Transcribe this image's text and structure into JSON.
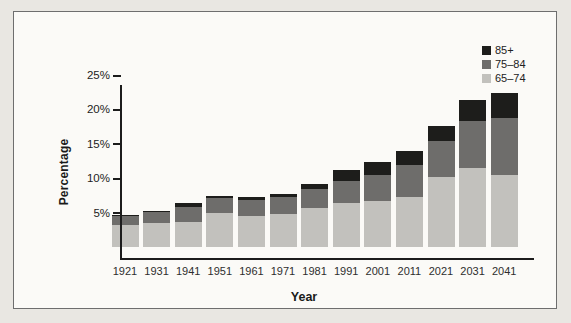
{
  "figure": {
    "y_axis_label": "Percentage",
    "x_axis_label": "Year"
  },
  "legend": [
    {
      "label": "85+",
      "color": "#1d1d1b"
    },
    {
      "label": "75–84",
      "color": "#6e6d6b"
    },
    {
      "label": "65–74",
      "color": "#c2c1bd"
    }
  ],
  "chart_data": {
    "type": "bar",
    "stacked": true,
    "title": "",
    "xlabel": "Year",
    "ylabel": "Percentage",
    "ylim": [
      0,
      25
    ],
    "grid": false,
    "legend_position": "top-right",
    "y_ticks": [
      {
        "value": 5,
        "label": "5%"
      },
      {
        "value": 10,
        "label": "10%"
      },
      {
        "value": 15,
        "label": "15%"
      },
      {
        "value": 20,
        "label": "20%"
      },
      {
        "value": 25,
        "label": "25%"
      }
    ],
    "categories": [
      "1921",
      "1931",
      "1941",
      "1951",
      "1961",
      "1971",
      "1981",
      "1991",
      "2001",
      "2011",
      "2021",
      "2031",
      "2041"
    ],
    "series": [
      {
        "name": "65–74",
        "color": "#c2c1bd",
        "values": [
          3.3,
          3.6,
          3.7,
          5.0,
          4.6,
          4.9,
          5.7,
          6.5,
          6.7,
          7.4,
          10.2,
          11.5,
          10.5
        ]
      },
      {
        "name": "75–84",
        "color": "#6e6d6b",
        "values": [
          1.3,
          1.5,
          2.2,
          2.2,
          2.3,
          2.5,
          2.8,
          3.1,
          3.8,
          4.6,
          5.3,
          6.9,
          8.3
        ]
      },
      {
        "name": "85+",
        "color": "#1d1d1b",
        "values": [
          0.1,
          0.2,
          0.5,
          0.3,
          0.4,
          0.4,
          0.8,
          1.6,
          1.9,
          2.0,
          2.2,
          3.0,
          3.7
        ]
      }
    ]
  }
}
